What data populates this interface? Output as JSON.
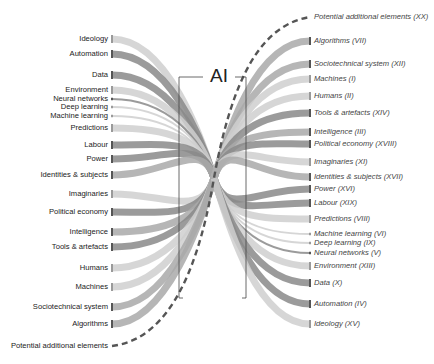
{
  "title": "AI",
  "left_items": [
    {
      "label": "Ideology",
      "shade": "light",
      "weight": "thick"
    },
    {
      "label": "Automation",
      "shade": "dark",
      "weight": "thick"
    },
    {
      "label": "Data",
      "shade": "dark",
      "weight": "thick"
    },
    {
      "label": "Environment",
      "shade": "light",
      "weight": "thick"
    },
    {
      "label": "Neural networks",
      "shade": "dark",
      "weight": "thin"
    },
    {
      "label": "Deep learning",
      "shade": "light",
      "weight": "thin"
    },
    {
      "label": "Machine learning",
      "shade": "light",
      "weight": "thin"
    },
    {
      "label": "Predictions",
      "shade": "light",
      "weight": "thick"
    },
    {
      "label": "Labour",
      "shade": "dark",
      "weight": "thick"
    },
    {
      "label": "Power",
      "shade": "dark",
      "weight": "thick"
    },
    {
      "label": "Identities & subjects",
      "shade": "mid",
      "weight": "thick"
    },
    {
      "label": "Imaginaries",
      "shade": "light",
      "weight": "thick"
    },
    {
      "label": "Political economy",
      "shade": "dark",
      "weight": "thick"
    },
    {
      "label": "Intelligence",
      "shade": "mid",
      "weight": "thick"
    },
    {
      "label": "Tools & artefacts",
      "shade": "dark",
      "weight": "thick"
    },
    {
      "label": "Humans",
      "shade": "light",
      "weight": "thick"
    },
    {
      "label": "Machines",
      "shade": "light",
      "weight": "thick"
    },
    {
      "label": "Sociotechnical system",
      "shade": "mid",
      "weight": "thick"
    },
    {
      "label": "Algorithms",
      "shade": "mid",
      "weight": "thick"
    }
  ],
  "left_potential": "Potential additional elements",
  "right_items": [
    {
      "label": "Algorithms (VII)",
      "shade": "mid",
      "weight": "thick"
    },
    {
      "label": "Sociotechnical system (XII)",
      "shade": "mid",
      "weight": "thick"
    },
    {
      "label": "Machines (I)",
      "shade": "light",
      "weight": "thick"
    },
    {
      "label": "Humans (II)",
      "shade": "light",
      "weight": "thick"
    },
    {
      "label": "Tools & artefacts (XIV)",
      "shade": "dark",
      "weight": "thick"
    },
    {
      "label": "Intelligence (III)",
      "shade": "mid",
      "weight": "thick"
    },
    {
      "label": "Political economy (XVIII)",
      "shade": "dark",
      "weight": "thick"
    },
    {
      "label": "Imaginaries (XI)",
      "shade": "light",
      "weight": "thick"
    },
    {
      "label": "Identities & subjects (XVII)",
      "shade": "mid",
      "weight": "thick"
    },
    {
      "label": "Power (XVI)",
      "shade": "dark",
      "weight": "thick"
    },
    {
      "label": "Labour (XIX)",
      "shade": "dark",
      "weight": "thick"
    },
    {
      "label": "Predictions (VIII)",
      "shade": "light",
      "weight": "thick"
    },
    {
      "label": "Machine learning (VI)",
      "shade": "light",
      "weight": "thin"
    },
    {
      "label": "Deep learning (IX)",
      "shade": "light",
      "weight": "thin"
    },
    {
      "label": "Neural networks (V)",
      "shade": "dark",
      "weight": "thin"
    },
    {
      "label": "Environment (XIII)",
      "shade": "light",
      "weight": "thick"
    },
    {
      "label": "Data (X)",
      "shade": "dark",
      "weight": "thick"
    },
    {
      "label": "Automation (IV)",
      "shade": "dark",
      "weight": "thick"
    },
    {
      "label": "Ideology (XV)",
      "shade": "light",
      "weight": "thick"
    }
  ],
  "right_potential": "Potential additional elements (XX)",
  "colors": {
    "light": "#cfcfcf",
    "mid": "#a9a9a9",
    "dark": "#8a8a8a",
    "dash": "#555555",
    "bracket": "#444444",
    "text": "#222222"
  }
}
